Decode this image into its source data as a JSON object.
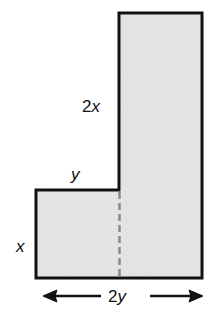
{
  "figure": {
    "labels": {
      "tall_side": "2x",
      "step_top": "y",
      "step_side": "x",
      "bottom_width": "2y"
    },
    "colors": {
      "fill": "#e4e4e4",
      "stroke": "#111111",
      "dashed": "#8a8a8a"
    }
  }
}
